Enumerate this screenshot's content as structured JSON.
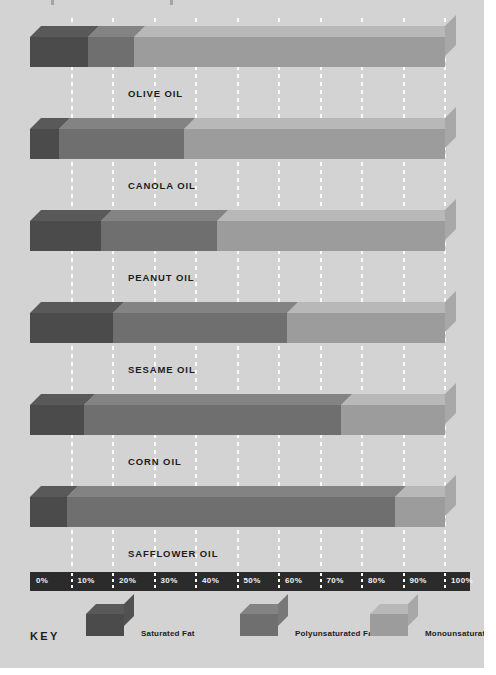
{
  "chart_data": {
    "type": "bar",
    "orientation": "horizontal",
    "stacked": true,
    "title": "",
    "xlabel": "",
    "ylabel": "",
    "xlim": [
      0,
      100
    ],
    "grid": true,
    "legend_position": "bottom",
    "legend_title": "KEY",
    "categories": [
      "OLIVE OIL",
      "CANOLA OIL",
      "PEANUT OIL",
      "SESAME OIL",
      "CORN OIL",
      "SAFFLOWER OIL"
    ],
    "series": [
      {
        "name": "Saturated Fat",
        "color": "#4b4b4b",
        "values": [
          14,
          7,
          17,
          20,
          13,
          9
        ]
      },
      {
        "name": "Polyunsaturated Fat",
        "color": "#6f6f6f",
        "values": [
          11,
          30,
          28,
          42,
          62,
          79
        ]
      },
      {
        "name": "Monounsaturated Fat",
        "color": "#9c9c9c",
        "values": [
          75,
          63,
          55,
          38,
          25,
          12
        ]
      }
    ],
    "tick_labels": [
      "0%",
      "10%",
      "20%",
      "30%",
      "40%",
      "50%",
      "60%",
      "70%",
      "80%",
      "90%",
      "100%"
    ],
    "tick_values": [
      0,
      10,
      20,
      30,
      40,
      50,
      60,
      70,
      80,
      90,
      100
    ]
  },
  "colors": {
    "page_background": "#d3d3d3",
    "axis_strip": "#2b2b2b",
    "axis_text": "#f2f2f2",
    "label_text": "#1c1c1c",
    "gridline": "#ffffff",
    "saturated": "#4b4b4b",
    "polyunsaturated": "#6f6f6f",
    "monounsaturated": "#9c9c9c"
  },
  "legend": {
    "title": "KEY",
    "items": [
      {
        "label": "Saturated Fat",
        "color": "#4b4b4b"
      },
      {
        "label": "Polyunsaturated Fat",
        "color": "#6f6f6f"
      },
      {
        "label": "Monounsaturated Fat",
        "color": "#9c9c9c"
      }
    ]
  }
}
